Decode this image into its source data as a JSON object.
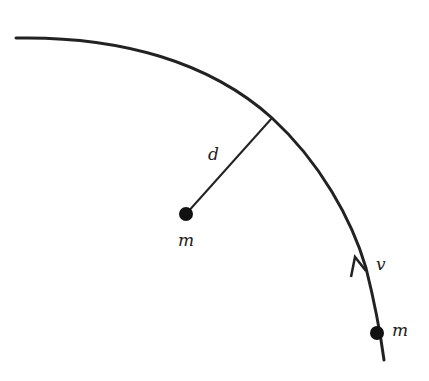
{
  "diagram": {
    "type": "orbit-trajectory",
    "labels": {
      "distance": "d",
      "central_mass": "m",
      "moving_mass": "m",
      "velocity": "v"
    },
    "colors": {
      "stroke": "#222222",
      "background": "#ffffff"
    }
  }
}
